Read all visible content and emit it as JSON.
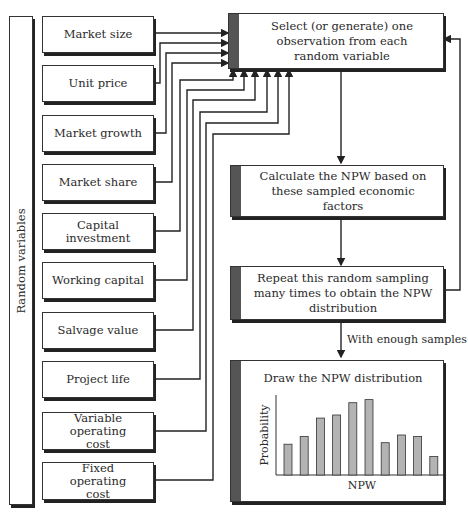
{
  "sidebar": {
    "title": "Random variables"
  },
  "variables": [
    {
      "label": "Market size"
    },
    {
      "label": "Unit price"
    },
    {
      "label": "Market growth"
    },
    {
      "label": "Market share"
    },
    {
      "label": "Capital investment"
    },
    {
      "label": "Working capital"
    },
    {
      "label": "Salvage value"
    },
    {
      "label": "Project life"
    },
    {
      "label": "Variable operating cost"
    },
    {
      "label": "Fixed operating cost"
    }
  ],
  "steps": [
    {
      "label": "Select (or generate) one observation from each random variable"
    },
    {
      "label": "Calculate the NPW based on these sampled economic factors"
    },
    {
      "label": "Repeat this random sampling many times to obtain the NPW distribution"
    },
    {
      "label": "Draw the NPW distribution"
    }
  ],
  "edge_labels": {
    "with_enough_samples": "With enough samples"
  },
  "chart_data": {
    "type": "bar",
    "title": "Draw the NPW distribution",
    "xlabel": "NPW",
    "ylabel": "Probability",
    "categories": [
      "1",
      "2",
      "3",
      "4",
      "5",
      "6",
      "7",
      "8",
      "9",
      "10"
    ],
    "values": [
      20,
      25,
      37,
      39,
      47,
      49,
      21,
      26,
      25,
      12
    ],
    "grid": false,
    "ylim": [
      0,
      52
    ]
  },
  "colors": {
    "accent_bar": "#555555",
    "bar_fill": "#b3b3b3",
    "line": "#222222"
  }
}
